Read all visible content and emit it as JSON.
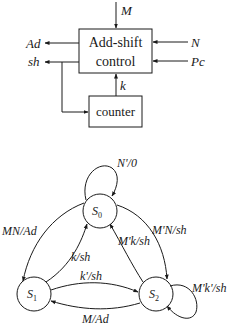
{
  "block_diagram": {
    "control_box": {
      "line1": "Add-shift",
      "line2": "control"
    },
    "counter_box": {
      "label": "counter"
    },
    "inputs": {
      "top": "M",
      "right_1": "N",
      "right_2": "Pc"
    },
    "outputs": {
      "left_1": "Ad",
      "left_2": "sh"
    },
    "counter_signal": "k"
  },
  "state_diagram": {
    "states": [
      {
        "id": "S0",
        "base": "S",
        "sub": "0"
      },
      {
        "id": "S1",
        "base": "S",
        "sub": "1"
      },
      {
        "id": "S2",
        "base": "S",
        "sub": "2"
      }
    ],
    "transitions": [
      {
        "from": "S0",
        "to": "S0",
        "label": "N'/0"
      },
      {
        "from": "S0",
        "to": "S1",
        "label": "MN/Ad"
      },
      {
        "from": "S1",
        "to": "S0",
        "label": "k/sh"
      },
      {
        "from": "S0",
        "to": "S2",
        "label": "M'N/sh"
      },
      {
        "from": "S2",
        "to": "S0",
        "label": "M'k/sh"
      },
      {
        "from": "S1",
        "to": "S2",
        "label": "k'/sh"
      },
      {
        "from": "S2",
        "to": "S1",
        "label": "M/Ad"
      },
      {
        "from": "S2",
        "to": "S2",
        "label": "M'k'/sh"
      }
    ]
  }
}
